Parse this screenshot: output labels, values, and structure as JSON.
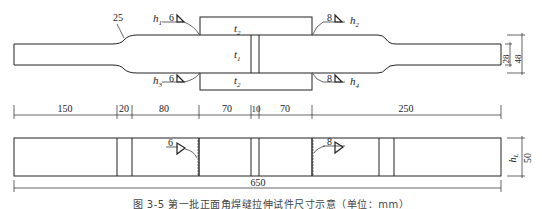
{
  "figure": {
    "caption": "图 3-5  第一批正面角焊缝拉伸试件尺寸示意（单位：mm）",
    "colors": {
      "line": "#222222",
      "background": "#ffffff"
    }
  },
  "top_view": {
    "radius_label": "25",
    "cover_plate_top_label": "t",
    "cover_plate_top_sub": "2",
    "cover_plate_bottom_label": "t",
    "cover_plate_bottom_sub": "2",
    "main_plate_label": "t",
    "main_plate_sub": "1",
    "welds": [
      {
        "id": "h1",
        "size": "6",
        "label": "h",
        "sub": "1"
      },
      {
        "id": "h2",
        "size": "8",
        "label": "h",
        "sub": "2"
      },
      {
        "id": "h3",
        "size": "6",
        "label": "h",
        "sub": "3"
      },
      {
        "id": "h4",
        "size": "8",
        "label": "h",
        "sub": "4"
      }
    ],
    "width_narrow": "28",
    "width_wide": "48"
  },
  "dimensions": {
    "segments": [
      "150",
      "20",
      "80",
      "70",
      "10",
      "70",
      "250"
    ],
    "total": "650"
  },
  "side_view": {
    "weld_left_size": "6",
    "weld_right_size": "8",
    "height_label": "h",
    "height_sub": "L",
    "height_value": "50"
  }
}
